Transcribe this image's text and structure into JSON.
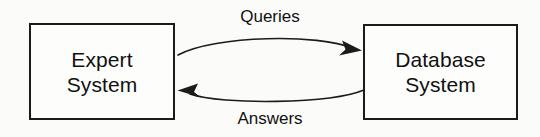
{
  "diagram": {
    "type": "block-flow",
    "background_color": "#fbfbf9",
    "stroke_color": "#1b1b1b",
    "nodes": [
      {
        "id": "expert-system",
        "shape": "rectangle",
        "line1": "Expert",
        "line2": "System"
      },
      {
        "id": "database-system",
        "shape": "rectangle",
        "line1": "Database",
        "line2": "System"
      }
    ],
    "edges": [
      {
        "id": "queries",
        "label": "Queries",
        "from": "expert-system",
        "to": "database-system",
        "direction": "left-to-right",
        "style": "curved-arc",
        "arrowhead": "filled-triangle"
      },
      {
        "id": "answers",
        "label": "Answers",
        "from": "database-system",
        "to": "expert-system",
        "direction": "right-to-left",
        "style": "curved-arc",
        "arrowhead": "filled-triangle"
      }
    ]
  }
}
